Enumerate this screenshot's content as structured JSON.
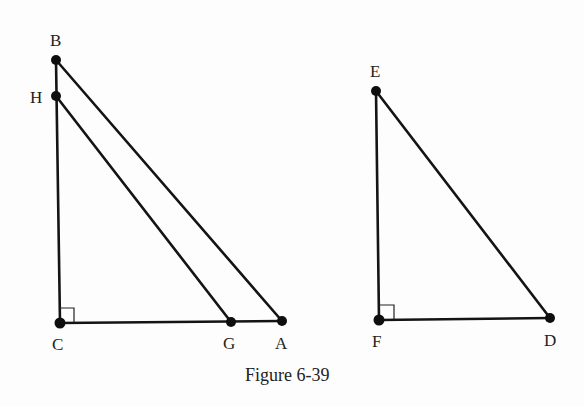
{
  "figure": {
    "caption": "Figure 6-39",
    "triangles": [
      {
        "name": "ABC",
        "vertices": [
          "A",
          "B",
          "C"
        ],
        "right_angle_at": "C"
      },
      {
        "name": "HGC",
        "vertices": [
          "H",
          "G",
          "C"
        ],
        "right_angle_at": "C",
        "note": "HG parallel to BA"
      },
      {
        "name": "DEF",
        "vertices": [
          "D",
          "E",
          "F"
        ],
        "right_angle_at": "F"
      }
    ],
    "points": {
      "B": {
        "label": "B",
        "x": 56,
        "y": 60
      },
      "H": {
        "label": "H",
        "x": 56,
        "y": 96
      },
      "C": {
        "label": "C",
        "x": 60,
        "y": 323
      },
      "G": {
        "label": "G",
        "x": 231,
        "y": 322
      },
      "A": {
        "label": "A",
        "x": 282,
        "y": 321
      },
      "E": {
        "label": "E",
        "x": 376,
        "y": 91
      },
      "F": {
        "label": "F",
        "x": 379,
        "y": 320
      },
      "D": {
        "label": "D",
        "x": 550,
        "y": 318
      }
    }
  }
}
